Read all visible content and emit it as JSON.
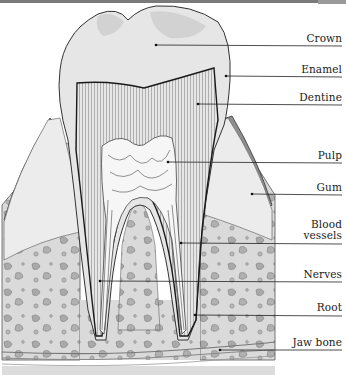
{
  "diagram": {
    "labels": [
      {
        "id": "crown",
        "text": "Crown",
        "line_y": 46,
        "point": [
          156,
          45
        ]
      },
      {
        "id": "enamel",
        "text": "Enamel",
        "line_y": 77,
        "point": [
          226,
          76
        ]
      },
      {
        "id": "dentine",
        "text": "Dentine",
        "line_y": 105,
        "point": [
          198,
          104
        ]
      },
      {
        "id": "pulp",
        "text": "Pulp",
        "line_y": 163,
        "point": [
          168,
          162
        ]
      },
      {
        "id": "gum",
        "text": "Gum",
        "line_y": 195,
        "point": [
          252,
          194
        ]
      },
      {
        "id": "blood_vessels",
        "text": "Blood vessels",
        "text_lines": [
          "Blood",
          "vessels"
        ],
        "line_y": 243,
        "point": [
          181,
          243
        ]
      },
      {
        "id": "nerves",
        "text": "Nerves",
        "line_y": 282,
        "point": [
          100,
          281
        ]
      },
      {
        "id": "root",
        "text": "Root",
        "line_y": 315,
        "point": [
          195,
          315
        ]
      },
      {
        "id": "jaw_bone",
        "text": "Jaw bone",
        "line_y": 350,
        "point": [
          220,
          350
        ]
      }
    ],
    "colors": {
      "background": "#ffffff",
      "enamel": "#e6e6e6",
      "dentine": "#c8c8c8",
      "pulp": "#f4f4f4",
      "gum": "#9a9a9a",
      "bone": "#d9d9d9",
      "bone_spots": "#a8a8a8",
      "lines": "#2a2a2a"
    }
  }
}
